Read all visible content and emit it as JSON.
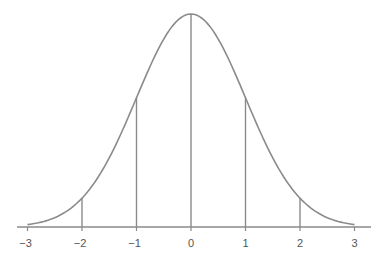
{
  "chart_data": {
    "type": "line",
    "title": "",
    "xlabel": "",
    "ylabel": "",
    "x": [
      -3,
      -2,
      -1,
      0,
      1,
      2,
      3
    ],
    "values": [
      0.0044,
      0.054,
      0.242,
      0.399,
      0.242,
      0.054,
      0.0044
    ],
    "series": [
      {
        "name": "normal density",
        "function": "exp(-x^2/2)/sqrt(2*pi)",
        "mean": 0,
        "sd": 1
      }
    ],
    "vertical_lines": [
      -2,
      -1,
      0,
      1,
      2
    ],
    "xlim": [
      -3.2,
      3.3
    ],
    "tick_labels": [
      "−3",
      "−2",
      "−1",
      "0",
      "1",
      "2",
      "3"
    ],
    "grid": false,
    "legend": null
  },
  "colors": {
    "curve": "#8a8a8a",
    "axis": "#8a8a8a",
    "lines": "#8a8a8a",
    "labels": "#555555"
  }
}
